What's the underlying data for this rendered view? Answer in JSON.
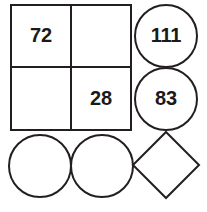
{
  "figure": {
    "canvas": {
      "width": 207,
      "height": 212,
      "background": "#ffffff"
    },
    "stroke_color": "#231f20",
    "text_color": "#1a1a1a",
    "stroke_width": 2
  },
  "grid": {
    "x": 11,
    "y": 5,
    "width": 120,
    "height": 125,
    "divider_x": 71,
    "divider_y": 67,
    "cells": [
      {
        "id": "top-left",
        "value": "72",
        "cx": 41,
        "cy": 36
      },
      {
        "id": "top-right",
        "value": "",
        "cx": 101,
        "cy": 36
      },
      {
        "id": "bottom-left",
        "value": "",
        "cx": 41,
        "cy": 99
      },
      {
        "id": "bottom-right",
        "value": "28",
        "cx": 101,
        "cy": 99
      }
    ]
  },
  "circles": [
    {
      "id": "circle-111",
      "value": "111",
      "cx": 166,
      "cy": 36,
      "r": 31
    },
    {
      "id": "circle-83",
      "value": "83",
      "cx": 166,
      "cy": 99,
      "r": 31
    },
    {
      "id": "circle-empty-left",
      "value": "",
      "cx": 40,
      "cy": 166,
      "r": 31
    },
    {
      "id": "circle-empty-right",
      "value": "",
      "cx": 102,
      "cy": 166,
      "r": 31
    }
  ],
  "diamond": {
    "id": "diamond-empty",
    "value": "",
    "cx": 166,
    "cy": 165,
    "half_diagonal": 33,
    "points": "166,132 199,165 166,198 133,165"
  },
  "values_summary": {
    "labels": [
      "72",
      "28",
      "111",
      "83"
    ]
  }
}
